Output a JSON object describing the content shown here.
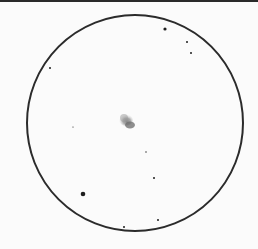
{
  "sketch": {
    "field_of_view": {
      "cx": 135,
      "cy": 123,
      "r": 108,
      "stroke": "#2b2b2b",
      "stroke_width": 2
    },
    "nebula": {
      "cx": 128,
      "cy": 122,
      "color": "#6a6a6a"
    },
    "stars": [
      {
        "x": 165,
        "y": 29,
        "r": 1.6
      },
      {
        "x": 187,
        "y": 42,
        "r": 1.0
      },
      {
        "x": 191,
        "y": 53,
        "r": 1.0
      },
      {
        "x": 50,
        "y": 68,
        "r": 1.0
      },
      {
        "x": 73,
        "y": 127,
        "r": 0.6
      },
      {
        "x": 146,
        "y": 152,
        "r": 0.7
      },
      {
        "x": 154,
        "y": 178,
        "r": 1.0
      },
      {
        "x": 83,
        "y": 194,
        "r": 2.3
      },
      {
        "x": 158,
        "y": 220,
        "r": 1.0
      },
      {
        "x": 124,
        "y": 227,
        "r": 1.0
      }
    ]
  }
}
